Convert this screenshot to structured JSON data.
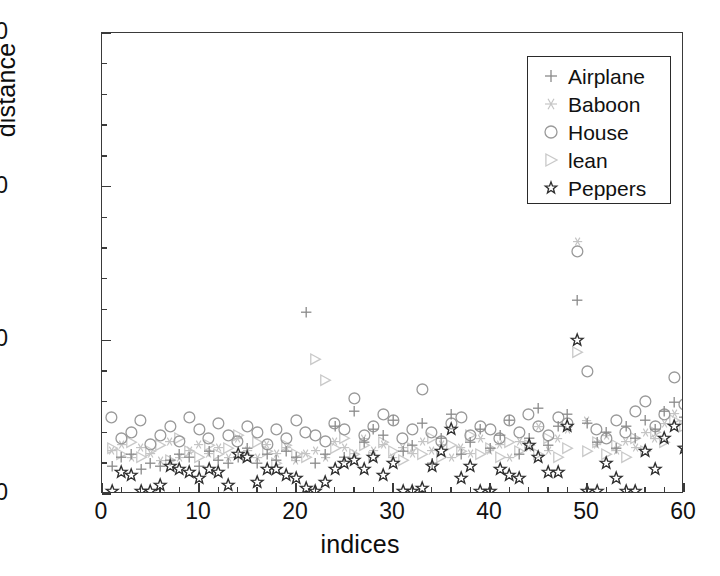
{
  "chart_data": {
    "type": "scatter",
    "title": "",
    "xlabel": "indices",
    "ylabel": "distance",
    "xlim": [
      0,
      60
    ],
    "ylim": [
      0,
      150
    ],
    "xticks": [
      0,
      10,
      20,
      30,
      40,
      50,
      60
    ],
    "yticks": [
      0,
      50,
      100,
      150
    ],
    "xtick_labels": [
      "0",
      "10",
      "20",
      "30",
      "40",
      "50",
      "60"
    ],
    "ytick_labels": [
      "0",
      "50",
      "100",
      "150"
    ],
    "x_minor_step": 2,
    "y_minor_step": 10,
    "grid": false,
    "legend_position": "top-right",
    "marker_colors": {
      "Airplane": "#8a8a8a",
      "Baboon": "#c4c4c4",
      "House": "#9a9a9a",
      "lean": "#c9c9c9",
      "Peppers": "#2e2e2e"
    },
    "x": [
      1,
      2,
      3,
      4,
      5,
      6,
      7,
      8,
      9,
      10,
      11,
      12,
      13,
      14,
      15,
      16,
      17,
      18,
      19,
      20,
      21,
      22,
      23,
      24,
      25,
      26,
      27,
      28,
      29,
      30,
      31,
      32,
      33,
      34,
      35,
      36,
      37,
      38,
      39,
      40,
      41,
      42,
      43,
      44,
      45,
      46,
      47,
      48,
      49,
      50,
      51,
      52,
      53,
      54,
      55,
      56,
      57,
      58,
      59,
      60
    ],
    "series": [
      {
        "name": "Airplane",
        "marker": "plus",
        "color": "#8a8a8a",
        "values": [
          9,
          12,
          13,
          8,
          10,
          9,
          11,
          13,
          12,
          9,
          14,
          11,
          10,
          12,
          15,
          10,
          13,
          11,
          14,
          12,
          59,
          10,
          13,
          22,
          12,
          27,
          17,
          21,
          19,
          24,
          14,
          16,
          23,
          10,
          18,
          26,
          13,
          17,
          21,
          15,
          19,
          24,
          13,
          18,
          28,
          16,
          22,
          26,
          63,
          23,
          17,
          20,
          15,
          22,
          18,
          24,
          21,
          27,
          30,
          25
        ]
      },
      {
        "name": "Baboon",
        "marker": "asterisk",
        "color": "#c4c4c4",
        "values": [
          14,
          16,
          12,
          15,
          13,
          11,
          17,
          12,
          14,
          16,
          13,
          15,
          12,
          18,
          14,
          12,
          16,
          13,
          15,
          11,
          13,
          14,
          12,
          17,
          15,
          13,
          18,
          14,
          16,
          12,
          15,
          13,
          17,
          14,
          16,
          12,
          15,
          13,
          18,
          14,
          16,
          12,
          17,
          15,
          22,
          14,
          18,
          21,
          82,
          24,
          16,
          19,
          14,
          17,
          15,
          20,
          18,
          23,
          26,
          24
        ]
      },
      {
        "name": "House",
        "marker": "circle",
        "color": "#9a9a9a",
        "values": [
          25,
          18,
          20,
          24,
          16,
          19,
          22,
          17,
          25,
          21,
          18,
          23,
          19,
          17,
          22,
          20,
          16,
          21,
          18,
          24,
          20,
          19,
          17,
          23,
          21,
          31,
          19,
          22,
          26,
          24,
          18,
          21,
          34,
          20,
          17,
          23,
          25,
          19,
          22,
          21,
          18,
          24,
          20,
          26,
          22,
          19,
          25,
          23,
          79,
          40,
          21,
          18,
          24,
          20,
          27,
          30,
          22,
          26,
          38,
          29
        ]
      },
      {
        "name": "lean",
        "marker": "triangle-right",
        "color": "#c9c9c9",
        "values": [
          15,
          13,
          17,
          12,
          14,
          16,
          11,
          18,
          14,
          12,
          16,
          13,
          15,
          19,
          12,
          17,
          14,
          10,
          16,
          13,
          12,
          44,
          37,
          15,
          18,
          13,
          16,
          12,
          17,
          14,
          11,
          15,
          13,
          18,
          12,
          16,
          14,
          19,
          13,
          15,
          12,
          17,
          14,
          16,
          13,
          18,
          12,
          15,
          46,
          14,
          17,
          13,
          16,
          12,
          18,
          14,
          20,
          17,
          24,
          22
        ]
      },
      {
        "name": "Peppers",
        "marker": "star",
        "color": "#2e2e2e",
        "values": [
          1,
          7,
          6,
          1,
          1,
          3,
          9,
          8,
          7,
          5,
          8,
          7,
          3,
          13,
          12,
          4,
          8,
          8,
          6,
          5,
          2,
          1,
          4,
          8,
          10,
          11,
          8,
          12,
          6,
          10,
          1,
          1,
          2,
          9,
          14,
          21,
          5,
          9,
          1,
          1,
          8,
          6,
          5,
          16,
          12,
          7,
          7,
          22,
          50,
          1,
          1,
          10,
          5,
          1,
          1,
          14,
          8,
          18,
          22,
          15
        ]
      }
    ]
  },
  "legend": {
    "items": [
      {
        "label": "Airplane",
        "marker": "plus"
      },
      {
        "label": "Baboon",
        "marker": "asterisk"
      },
      {
        "label": "House",
        "marker": "circle"
      },
      {
        "label": "lean",
        "marker": "triangle-right"
      },
      {
        "label": "Peppers",
        "marker": "star"
      }
    ]
  }
}
